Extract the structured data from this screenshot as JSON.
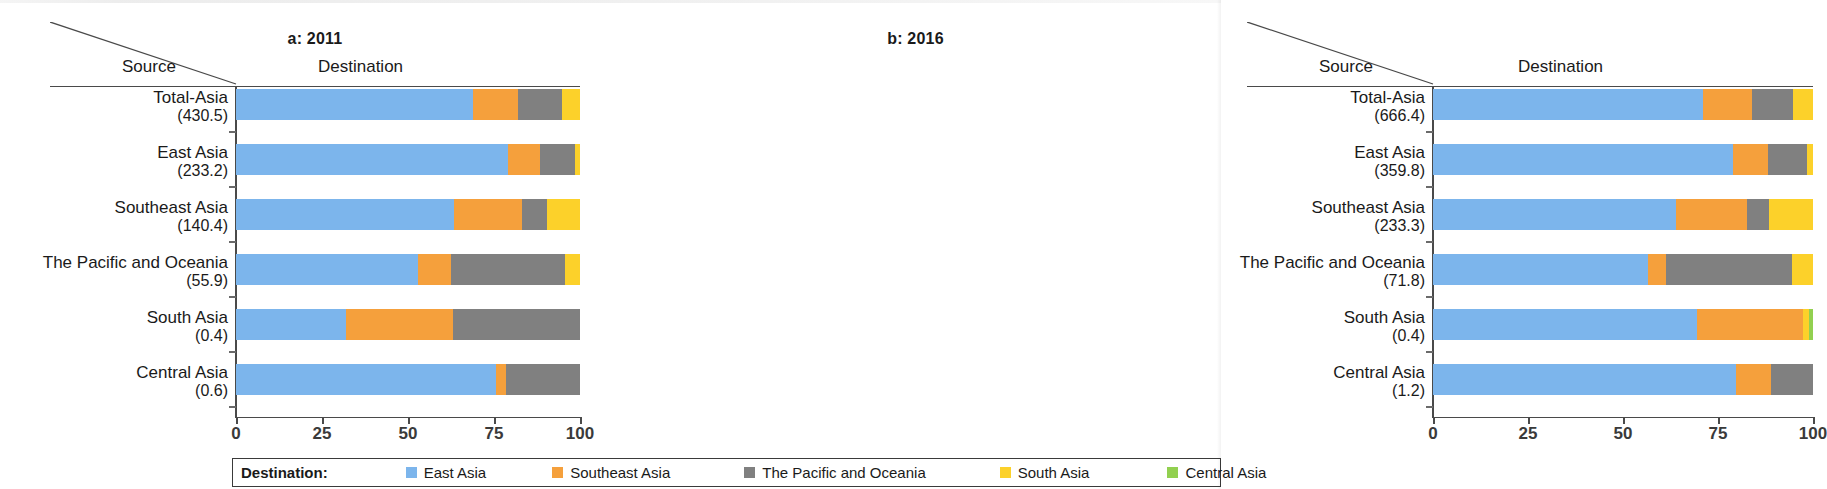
{
  "legend": {
    "title": "Destination:",
    "items": [
      {
        "label": "East Asia",
        "color": "#7cb5ec"
      },
      {
        "label": "Southeast Asia",
        "color": "#f7a councillors"
      },
      {
        "label": "The Pacific and Oceania",
        "color": "#808080"
      },
      {
        "label": "South Asia",
        "color": "#fcd12a"
      },
      {
        "label": "Central Asia",
        "color": "#92d050"
      }
    ]
  },
  "colors": {
    "east_asia": "#7cb5ec",
    "southeast_asia": "#f5a03c",
    "pacific_oceania": "#808080",
    "south_asia": "#fcd12a",
    "central_asia": "#92d050",
    "axis": "#4a4a4a",
    "text": "#1a1a1a"
  },
  "axis": {
    "ticks": [
      "0",
      "25",
      "50",
      "75",
      "100"
    ],
    "tick_values": [
      0,
      25,
      50,
      75,
      100
    ],
    "header_source": "Source",
    "header_destination": "Destination"
  },
  "panels": [
    {
      "id": "a",
      "title": "a: 2011"
    },
    {
      "id": "b",
      "title": "b: 2016"
    }
  ],
  "chart_data": {
    "type": "bar",
    "orientation": "horizontal",
    "stacked": true,
    "normalized_percent": true,
    "title": "",
    "xlabel": "",
    "ylabel": "Source",
    "xlim": [
      0,
      100
    ],
    "grid": false,
    "legend_position": "bottom",
    "series": [
      {
        "name": "East Asia",
        "color": "#7cb5ec"
      },
      {
        "name": "Southeast Asia",
        "color": "#f5a03c"
      },
      {
        "name": "The Pacific and Oceania",
        "color": "#808080"
      },
      {
        "name": "South Asia",
        "color": "#fcd12a"
      },
      {
        "name": "Central Asia",
        "color": "#92d050"
      }
    ],
    "panels": [
      {
        "id": "a",
        "title": "a: 2011",
        "categories": [
          {
            "name": "Total-Asia",
            "total": "(430.5)"
          },
          {
            "name": "East Asia",
            "total": "(233.2)"
          },
          {
            "name": "Southeast Asia",
            "total": "(140.4)"
          },
          {
            "name": "The Pacific and Oceania",
            "total": "(55.9)"
          },
          {
            "name": "South Asia",
            "total": "(0.4)"
          },
          {
            "name": "Central Asia",
            "total": "(0.6)"
          }
        ],
        "values": [
          [
            69.0,
            13.0,
            12.8,
            5.2,
            0.0
          ],
          [
            79.0,
            9.5,
            10.0,
            1.5,
            0.0
          ],
          [
            63.5,
            19.5,
            7.5,
            9.5,
            0.0
          ],
          [
            53.0,
            9.5,
            33.0,
            4.5,
            0.0
          ],
          [
            32.0,
            31.0,
            37.0,
            0.0,
            0.0
          ],
          [
            75.5,
            3.0,
            21.5,
            0.0,
            0.0
          ]
        ]
      },
      {
        "id": "b",
        "title": "b: 2016",
        "categories": [
          {
            "name": "Total-Asia",
            "total": "(666.4)"
          },
          {
            "name": "East Asia",
            "total": "(359.8)"
          },
          {
            "name": "Southeast Asia",
            "total": "(233.3)"
          },
          {
            "name": "The Pacific and Oceania",
            "total": "(71.8)"
          },
          {
            "name": "South Asia",
            "total": "(0.4)"
          },
          {
            "name": "Central Asia",
            "total": "(1.2)"
          }
        ],
        "values": [
          [
            71.0,
            13.0,
            10.7,
            5.3,
            0.0
          ],
          [
            79.0,
            9.2,
            10.3,
            1.5,
            0.0
          ],
          [
            64.0,
            18.7,
            5.8,
            11.5,
            0.0
          ],
          [
            56.5,
            4.8,
            33.2,
            5.5,
            0.0
          ],
          [
            69.5,
            27.9,
            0.0,
            1.6,
            1.0
          ],
          [
            79.7,
            9.2,
            11.1,
            0.0,
            0.0
          ]
        ]
      }
    ]
  }
}
